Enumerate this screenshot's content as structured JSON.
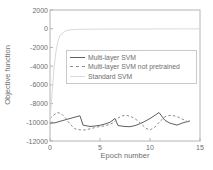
{
  "colors": {
    "axis": "#b4b4b4",
    "text": "#6e6e6e",
    "background": "#ffffff",
    "legend_border": "#c9c9c9"
  },
  "chart_data": {
    "type": "line",
    "title": "",
    "xlabel": "Epoch number",
    "ylabel": "Objective function",
    "xlim": [
      0,
      15
    ],
    "ylim": [
      -12000,
      2000
    ],
    "xticks": [
      0,
      5,
      10,
      15
    ],
    "yticks": [
      2000,
      0,
      -2000,
      -4000,
      -6000,
      -8000,
      -10000,
      -12000
    ],
    "grid": false,
    "legend_position": "upper-right-inside",
    "series": [
      {
        "name": "Multi-layer SVM",
        "style": "solid",
        "color": "#5f5f5f",
        "points": [
          [
            0,
            -10100
          ],
          [
            0.5,
            -10050
          ],
          [
            1,
            -9900
          ],
          [
            1.5,
            -9750
          ],
          [
            2,
            -9600
          ],
          [
            2.5,
            -9450
          ],
          [
            3,
            -9310
          ],
          [
            3.3,
            -10300
          ],
          [
            4,
            -10450
          ],
          [
            4.5,
            -10400
          ],
          [
            5,
            -10320
          ],
          [
            5.5,
            -10180
          ],
          [
            6,
            -10000
          ],
          [
            6.5,
            -9600
          ],
          [
            6.8,
            -10350
          ],
          [
            7.5,
            -10450
          ],
          [
            8,
            -10470
          ],
          [
            8.5,
            -10350
          ],
          [
            9,
            -10150
          ],
          [
            9.5,
            -9900
          ],
          [
            10,
            -9600
          ],
          [
            10.5,
            -9250
          ],
          [
            10.9,
            -8950
          ],
          [
            11.5,
            -9800
          ],
          [
            12,
            -10100
          ],
          [
            12.7,
            -10300
          ],
          [
            13.3,
            -10050
          ],
          [
            14,
            -9850
          ]
        ]
      },
      {
        "name": "Multi-layer SVM not pretrained",
        "style": "dashed",
        "color": "#8c8c8c",
        "points": [
          [
            0,
            -9600
          ],
          [
            0.4,
            -9200
          ],
          [
            0.8,
            -8950
          ],
          [
            1.2,
            -9150
          ],
          [
            1.6,
            -9600
          ],
          [
            2,
            -10200
          ],
          [
            2.5,
            -10700
          ],
          [
            3,
            -10800
          ],
          [
            3.5,
            -10820
          ],
          [
            4,
            -10700
          ],
          [
            4.5,
            -10570
          ],
          [
            5,
            -10450
          ],
          [
            5.5,
            -10380
          ],
          [
            6,
            -10220
          ],
          [
            6.4,
            -10000
          ],
          [
            6.8,
            -9550
          ],
          [
            7.2,
            -9320
          ],
          [
            7.6,
            -9250
          ],
          [
            8,
            -9350
          ],
          [
            8.4,
            -9550
          ],
          [
            8.8,
            -9850
          ],
          [
            9.2,
            -10250
          ],
          [
            9.6,
            -10650
          ],
          [
            10,
            -10820
          ],
          [
            10.5,
            -10500
          ],
          [
            11,
            -9900
          ],
          [
            11.5,
            -9400
          ],
          [
            12,
            -9250
          ],
          [
            12.5,
            -9320
          ],
          [
            13,
            -9520
          ],
          [
            13.5,
            -9800
          ],
          [
            14,
            -10050
          ]
        ]
      },
      {
        "name": "Standard SVM",
        "style": "solid",
        "color": "#d9d9d9",
        "points": [
          [
            0,
            -9800
          ],
          [
            0.2,
            -7000
          ],
          [
            0.4,
            -4200
          ],
          [
            0.6,
            -2400
          ],
          [
            0.8,
            -1300
          ],
          [
            1,
            -700
          ],
          [
            1.5,
            -250
          ],
          [
            2,
            -120
          ],
          [
            3,
            -60
          ],
          [
            5,
            -40
          ],
          [
            8,
            -30
          ],
          [
            12,
            -25
          ],
          [
            15,
            -20
          ]
        ]
      }
    ]
  }
}
